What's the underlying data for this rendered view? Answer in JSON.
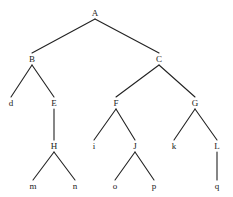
{
  "diagram": {
    "type": "node-link-tree",
    "width": 233,
    "height": 197,
    "background_color": "#ffffff",
    "edge_color": "#222222",
    "label_color": "#1a1a1a",
    "edge_width": 1.1,
    "root": "A",
    "nodes": [
      {
        "id": "A",
        "label": "A",
        "x": 95,
        "y": 13,
        "depth": 0,
        "parent": null
      },
      {
        "id": "B",
        "label": "B",
        "x": 32,
        "y": 59,
        "depth": 1,
        "parent": "A"
      },
      {
        "id": "C",
        "label": "C",
        "x": 159,
        "y": 59,
        "depth": 1,
        "parent": "A"
      },
      {
        "id": "d",
        "label": "d",
        "x": 11,
        "y": 103,
        "depth": 2,
        "parent": "B"
      },
      {
        "id": "E",
        "label": "E",
        "x": 54,
        "y": 103,
        "depth": 2,
        "parent": "B"
      },
      {
        "id": "F",
        "label": "F",
        "x": 116,
        "y": 103,
        "depth": 2,
        "parent": "C"
      },
      {
        "id": "G",
        "label": "G",
        "x": 195,
        "y": 103,
        "depth": 2,
        "parent": "C"
      },
      {
        "id": "H",
        "label": "H",
        "x": 54,
        "y": 146,
        "depth": 3,
        "parent": "E"
      },
      {
        "id": "i",
        "label": "i",
        "x": 94,
        "y": 146,
        "depth": 3,
        "parent": "F"
      },
      {
        "id": "J",
        "label": "J",
        "x": 135,
        "y": 146,
        "depth": 3,
        "parent": "F"
      },
      {
        "id": "k",
        "label": "k",
        "x": 174,
        "y": 146,
        "depth": 3,
        "parent": "G"
      },
      {
        "id": "L",
        "label": "L",
        "x": 217,
        "y": 146,
        "depth": 3,
        "parent": "G"
      },
      {
        "id": "m",
        "label": "m",
        "x": 33,
        "y": 186,
        "depth": 4,
        "parent": "H"
      },
      {
        "id": "n",
        "label": "n",
        "x": 75,
        "y": 186,
        "depth": 4,
        "parent": "H"
      },
      {
        "id": "o",
        "label": "o",
        "x": 115,
        "y": 186,
        "depth": 4,
        "parent": "J"
      },
      {
        "id": "p",
        "label": "p",
        "x": 154,
        "y": 186,
        "depth": 4,
        "parent": "J"
      },
      {
        "id": "q",
        "label": "q",
        "x": 217,
        "y": 186,
        "depth": 4,
        "parent": "L"
      }
    ],
    "edges": [
      {
        "from": "A",
        "to": "B"
      },
      {
        "from": "A",
        "to": "C"
      },
      {
        "from": "B",
        "to": "d"
      },
      {
        "from": "B",
        "to": "E"
      },
      {
        "from": "C",
        "to": "F"
      },
      {
        "from": "C",
        "to": "G"
      },
      {
        "from": "E",
        "to": "H"
      },
      {
        "from": "F",
        "to": "i"
      },
      {
        "from": "F",
        "to": "J"
      },
      {
        "from": "G",
        "to": "k"
      },
      {
        "from": "G",
        "to": "L"
      },
      {
        "from": "H",
        "to": "m"
      },
      {
        "from": "H",
        "to": "n"
      },
      {
        "from": "J",
        "to": "o"
      },
      {
        "from": "J",
        "to": "p"
      },
      {
        "from": "L",
        "to": "q"
      }
    ]
  }
}
